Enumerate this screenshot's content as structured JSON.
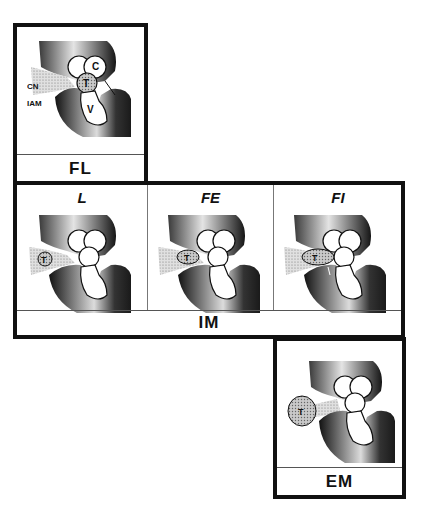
{
  "figure": {
    "type": "anatomical schematic of tumor location relative to internal auditory meatus",
    "panels": [
      {
        "id": "FL",
        "caption": "FL",
        "labels": {
          "cn": "CN",
          "iam": "IAM",
          "t": "T",
          "c": "C",
          "v": "V"
        }
      },
      {
        "id": "IM",
        "caption": "IM",
        "subpanels": [
          {
            "title": "L",
            "tumor_label": "T"
          },
          {
            "title": "FE",
            "tumor_label": "T"
          },
          {
            "title": "FI",
            "tumor_label": "T"
          }
        ]
      },
      {
        "id": "EM",
        "caption": "EM",
        "tumor_label": "T"
      }
    ]
  },
  "colors": {
    "border": "#111111",
    "bone_dark": "#1a1a1a",
    "bone_light": "#d8d8d8",
    "tumor_fill": "#bdbdbd",
    "background": "#ffffff"
  }
}
